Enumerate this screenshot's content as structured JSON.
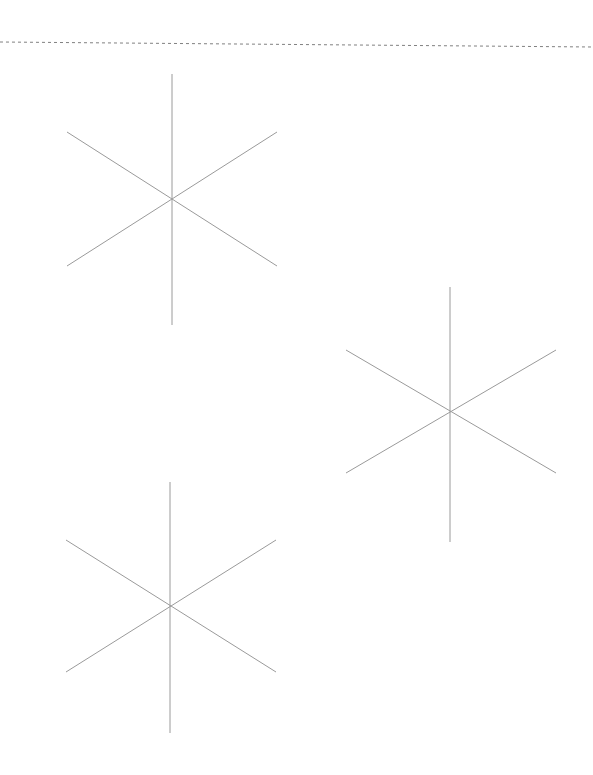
{
  "page": {
    "title": "Scanned sheet with six-pointed star figures",
    "width": 593,
    "height": 775,
    "background_color": "#ffffff",
    "text_content": "",
    "visible_labels": []
  },
  "artifacts": {
    "top_edge_line": {
      "name": "dotted scan edge line",
      "style": "dashed",
      "color": "#555555",
      "opacity": 0.75,
      "thickness": 1,
      "x_start": 0,
      "y_start": 42,
      "x_end": 593,
      "y_end": 47,
      "dash_pattern": "3 3"
    }
  },
  "drawing": {
    "stroke_color": "#9a9a9a",
    "stroke_width": 1,
    "figure_type": "six-pointed-star",
    "figure_description": "Three straight lines crossing at a common centre forming a six-pointed asterisk (snowflake skeleton): one vertical line and two diagonals at plus and minus 30 degrees from horizontal.",
    "figures": [
      {
        "id": "star-1",
        "label": "Star figure 1 (upper left)",
        "center_x": 172,
        "center_y": 199,
        "vertical_top_y": 74,
        "vertical_bottom_y": 325,
        "diagonal_left_x": 67,
        "diagonal_right_x": 277,
        "diagonal_top_y": 132,
        "diagonal_bottom_y": 266,
        "arm_count": 6,
        "radius": 126
      },
      {
        "id": "star-2",
        "label": "Star figure 2 (middle right)",
        "center_x": 450,
        "center_y": 411,
        "vertical_top_y": 287,
        "vertical_bottom_y": 542,
        "diagonal_left_x": 346,
        "diagonal_right_x": 556,
        "diagonal_top_y": 350,
        "diagonal_bottom_y": 473,
        "arm_count": 6,
        "radius": 126
      },
      {
        "id": "star-3",
        "label": "Star figure 3 (lower left)",
        "center_x": 170,
        "center_y": 606,
        "vertical_top_y": 482,
        "vertical_bottom_y": 733,
        "diagonal_left_x": 66,
        "diagonal_right_x": 276,
        "diagonal_top_y": 540,
        "diagonal_bottom_y": 672,
        "arm_count": 6,
        "radius": 126
      }
    ]
  }
}
